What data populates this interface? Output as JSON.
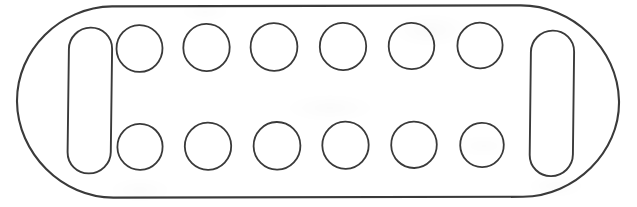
{
  "document": {
    "kind": "technical-line-drawing",
    "title": "Rounded rectangular tray outline with two slots and fourteen circular wells",
    "background_color": "#ffffff",
    "stroke_color": "#3a3a3a",
    "fill_color": "none",
    "canvas": {
      "width": 637,
      "height": 207
    }
  },
  "drawing": {
    "outer_outline": {
      "name": "outer-rounded-rectangle",
      "shape": "rounded-rectangle",
      "x": 17,
      "y": 6,
      "width": 603,
      "height": 191,
      "corner_radius": 94,
      "stroke_width": 2.1
    },
    "slots": [
      {
        "name": "left-slot",
        "shape": "stadium",
        "x": 68,
        "y": 28,
        "width": 44,
        "height": 145,
        "corner_radius": 22,
        "stroke_width": 1.9
      },
      {
        "name": "right-slot",
        "shape": "stadium",
        "x": 530,
        "y": 31,
        "width": 44,
        "height": 145,
        "corner_radius": 22,
        "stroke_width": 1.9
      }
    ],
    "circle_rows": [
      {
        "name": "top-row",
        "center_y": 48,
        "radius_x": 23,
        "radius_y": 23,
        "stroke_width": 1.8,
        "count": 7,
        "center_xs": [
          139,
          205,
          271,
          337,
          403,
          469,
          490
        ]
      },
      {
        "name": "bottom-row",
        "center_y": 146,
        "radius_x": 23,
        "radius_y": 23,
        "stroke_width": 1.8,
        "count": 7,
        "center_xs": [
          139,
          205,
          271,
          337,
          403,
          469,
          490
        ]
      }
    ],
    "top_row_circles": [
      {
        "label": "top-well-1",
        "cx": 139,
        "cy": 47,
        "rx": 23,
        "ry": 23
      },
      {
        "label": "top-well-2",
        "cx": 206,
        "cy": 47,
        "rx": 23,
        "ry": 23
      },
      {
        "label": "top-well-3",
        "cx": 274,
        "cy": 47,
        "rx": 23,
        "ry": 23
      },
      {
        "label": "top-well-4",
        "cx": 343,
        "cy": 47,
        "rx": 23,
        "ry": 23
      },
      {
        "label": "top-well-5",
        "cx": 412,
        "cy": 47,
        "rx": 23,
        "ry": 23
      },
      {
        "label": "top-well-6",
        "cx": 480,
        "cy": 48,
        "rx": 23,
        "ry": 23
      },
      {
        "label": "top-well-7",
        "cx": 500,
        "cy": 48,
        "rx": 23,
        "ry": 23
      }
    ],
    "bottom_row_circles": [
      {
        "label": "bottom-well-1",
        "cx": 139,
        "cy": 146,
        "rx": 23,
        "ry": 23
      },
      {
        "label": "bottom-well-2",
        "cx": 208,
        "cy": 146,
        "rx": 23,
        "ry": 23
      },
      {
        "label": "bottom-well-3",
        "cx": 277,
        "cy": 146,
        "rx": 23,
        "ry": 23
      },
      {
        "label": "bottom-well-4",
        "cx": 345,
        "cy": 146,
        "rx": 23,
        "ry": 23
      },
      {
        "label": "bottom-well-5",
        "cx": 414,
        "cy": 146,
        "rx": 23,
        "ry": 23
      },
      {
        "label": "bottom-well-6",
        "cx": 482,
        "cy": 147,
        "rx": 22,
        "ry": 22
      },
      {
        "label": "bottom-well-7",
        "cx": 500,
        "cy": 147,
        "rx": 22,
        "ry": 22
      }
    ],
    "counts": {
      "slots": 2,
      "circles_top": 7,
      "circles_bottom": 7,
      "circles_total": 14
    }
  }
}
